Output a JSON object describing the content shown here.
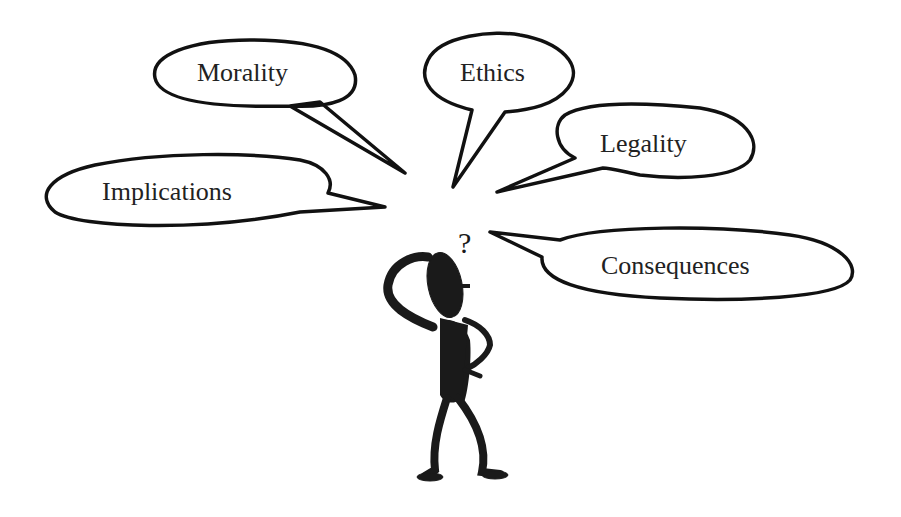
{
  "bubbles": {
    "morality": "Morality",
    "ethics": "Ethics",
    "legality": "Legality",
    "implications": "Implications",
    "consequences": "Consequences"
  },
  "figure": {
    "question_mark": "?"
  }
}
